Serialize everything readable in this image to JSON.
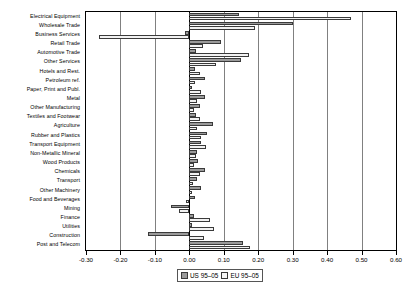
{
  "chart_data": {
    "type": "bar",
    "orientation": "horizontal",
    "title": "",
    "xlabel": "",
    "ylabel": "",
    "xlim": [
      -0.3,
      0.6
    ],
    "xticks": [
      -0.3,
      -0.2,
      -0.1,
      0.0,
      0.1,
      0.2,
      0.3,
      0.4,
      0.5,
      0.6
    ],
    "xticklabels": [
      "-0.30",
      "-0.20",
      "-0.10",
      "0.00",
      "0.10",
      "0.20",
      "0.30",
      "0.40",
      "0.50",
      "0.60"
    ],
    "grid": true,
    "legend_position": "bottom",
    "categories": [
      "Electrical Equipment",
      "Wholesale Trade",
      "Business Services",
      "Retail Trade",
      "Automotive Trade",
      "Other Services",
      "Hotels and Rest.",
      "Petroleum ref.",
      "Paper, Print and Publ.",
      "Metal",
      "Other Manufacturing",
      "Textiles and Footwear",
      "Agriculture",
      "Rubber and Plastics",
      "Transport Equipment",
      "Non-Metallic Mineral",
      "Wood Products",
      "Chemicals",
      "Transport",
      "Other Machinery",
      "Food and Beverages",
      "Mining",
      "Finance",
      "Utilities",
      "Construction",
      "Post and Telecom"
    ],
    "series": [
      {
        "name": "US 95-05",
        "color": "#9a9a9a",
        "values": [
          0.145,
          0.3,
          -0.013,
          0.093,
          0.018,
          0.15,
          0.017,
          0.045,
          0.007,
          0.045,
          0.031,
          0.02,
          0.068,
          0.052,
          0.033,
          0.021,
          0.025,
          0.045,
          0.021,
          0.035,
          0.017,
          -0.052,
          0.013,
          0.007,
          -0.12,
          0.157
        ]
      },
      {
        "name": "EU 95-05",
        "color": "#f2f2f2",
        "values": [
          0.47,
          0.19,
          -0.262,
          0.039,
          0.172,
          0.077,
          0.03,
          0.016,
          0.034,
          0.021,
          0.013,
          0.03,
          0.023,
          0.033,
          0.049,
          0.02,
          0.013,
          0.03,
          0.01,
          0.009,
          -0.011,
          -0.029,
          0.06,
          0.071,
          0.044,
          0.176
        ]
      }
    ]
  },
  "legend": {
    "items": [
      {
        "label": "US 95–05",
        "swatch": "us"
      },
      {
        "label": "EU 95–05",
        "swatch": "eu"
      }
    ]
  }
}
